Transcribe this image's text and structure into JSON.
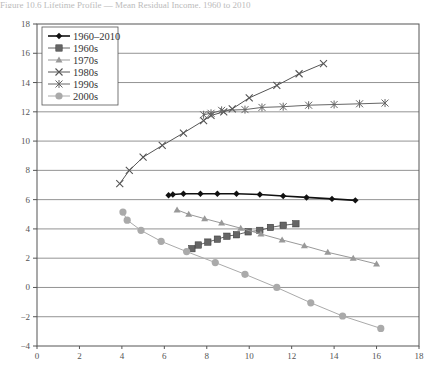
{
  "header": {
    "caption": "Figure 10.6 Lifetime Profile — Mean Residual Income, 1960 to 2010"
  },
  "chart_data": {
    "type": "line",
    "title": "",
    "xlabel": "",
    "ylabel": "",
    "xlim": [
      0,
      18
    ],
    "ylim": [
      -4,
      18
    ],
    "x_ticks": [
      0,
      2,
      4,
      6,
      8,
      10,
      12,
      14,
      16,
      18
    ],
    "y_ticks": [
      -4,
      -2,
      0,
      2,
      4,
      6,
      8,
      10,
      12,
      14,
      16,
      18
    ],
    "grid": "horizontal",
    "legend_position": "upper-left",
    "series": [
      {
        "name": "1960–2010",
        "marker": "diamond",
        "color": "#111111",
        "x": [
          6.2,
          6.4,
          6.9,
          7.7,
          8.5,
          9.4,
          10.5,
          11.6,
          12.7,
          13.9,
          15.0
        ],
        "y": [
          6.3,
          6.35,
          6.4,
          6.4,
          6.4,
          6.4,
          6.35,
          6.25,
          6.15,
          6.05,
          5.95
        ]
      },
      {
        "name": "1960s",
        "marker": "square",
        "color": "#666666",
        "x": [
          7.3,
          7.6,
          8.05,
          8.5,
          8.95,
          9.4,
          9.95,
          10.5,
          11.0,
          11.6,
          12.2
        ],
        "y": [
          2.65,
          2.9,
          3.1,
          3.3,
          3.5,
          3.6,
          3.8,
          3.9,
          4.1,
          4.25,
          4.35
        ]
      },
      {
        "name": "1970s",
        "marker": "triangle",
        "color": "#999999",
        "x": [
          6.6,
          7.15,
          7.9,
          8.7,
          9.6,
          10.55,
          11.55,
          12.6,
          13.7,
          14.9,
          16.0
        ],
        "y": [
          5.3,
          5.0,
          4.7,
          4.4,
          4.05,
          3.65,
          3.25,
          2.85,
          2.4,
          2.0,
          1.6
        ]
      },
      {
        "name": "1980s",
        "marker": "x",
        "color": "#555555",
        "x": [
          3.9,
          4.35,
          5.0,
          5.9,
          6.9,
          7.85,
          8.2,
          8.8,
          9.2,
          10.0,
          11.3,
          12.35,
          13.5
        ],
        "y": [
          7.1,
          8.0,
          8.9,
          9.7,
          10.55,
          11.4,
          11.75,
          12.0,
          12.2,
          12.95,
          13.8,
          14.6,
          15.3
        ]
      },
      {
        "name": "1990s",
        "marker": "asterisk",
        "color": "#666666",
        "x": [
          7.85,
          8.2,
          8.7,
          9.8,
          10.6,
          11.6,
          12.8,
          14.0,
          15.2,
          16.4
        ],
        "y": [
          11.8,
          11.9,
          12.1,
          12.15,
          12.3,
          12.35,
          12.45,
          12.5,
          12.55,
          12.6
        ]
      },
      {
        "name": "2000s",
        "marker": "circle",
        "color": "#aaaaaa",
        "x": [
          4.05,
          4.25,
          4.9,
          5.85,
          7.05,
          8.4,
          9.8,
          11.3,
          12.9,
          14.4,
          16.2
        ],
        "y": [
          5.15,
          4.6,
          3.9,
          3.15,
          2.45,
          1.7,
          0.9,
          0.0,
          -1.05,
          -1.95,
          -2.8
        ]
      }
    ]
  }
}
